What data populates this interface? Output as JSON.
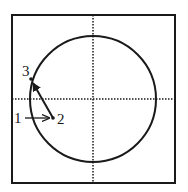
{
  "diagram": {
    "labels": {
      "p1": "1",
      "p2": "2",
      "p3": "3"
    },
    "colors": {
      "stroke": "#1a1a1a",
      "background": "#ffffff"
    }
  }
}
